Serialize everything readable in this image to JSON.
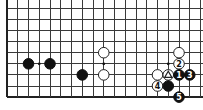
{
  "diagram": {
    "type": "go-board-fragment",
    "grid": {
      "columns": 19,
      "rows": 9,
      "origin_x": 7,
      "origin_y": 8.3,
      "spacing_x": 10.75,
      "spacing_y": 11.1,
      "edges": [
        "left",
        "bottom"
      ]
    },
    "colors": {
      "black": "#111111",
      "white": "#ffffff",
      "line": "#3a3a3a",
      "background": "#ffffff"
    },
    "star_points": [
      {
        "col": 3,
        "row": 5
      },
      {
        "col": 9,
        "row": 5
      },
      {
        "col": 15,
        "row": 5
      }
    ],
    "stones": [
      {
        "color": "black",
        "col": 2,
        "row": 5,
        "label": ""
      },
      {
        "color": "black",
        "col": 4,
        "row": 5,
        "label": ""
      },
      {
        "color": "black",
        "col": 7,
        "row": 6,
        "label": ""
      },
      {
        "color": "white",
        "col": 9,
        "row": 4,
        "label": ""
      },
      {
        "color": "white",
        "col": 9,
        "row": 6,
        "label": ""
      },
      {
        "color": "white",
        "col": 16,
        "row": 4,
        "label": ""
      },
      {
        "color": "white",
        "col": 16,
        "row": 5,
        "label": "2"
      },
      {
        "color": "white",
        "col": 14,
        "row": 6,
        "label": ""
      },
      {
        "color": "white",
        "col": 15,
        "row": 6,
        "label": "",
        "mark": "triangle"
      },
      {
        "color": "black",
        "col": 16,
        "row": 6,
        "label": "1"
      },
      {
        "color": "black",
        "col": 17,
        "row": 6,
        "label": "3"
      },
      {
        "color": "white",
        "col": 14,
        "row": 7,
        "label": "4"
      },
      {
        "color": "black",
        "col": 15,
        "row": 7,
        "label": ""
      },
      {
        "color": "black",
        "col": 16,
        "row": 8,
        "label": "5"
      }
    ]
  }
}
